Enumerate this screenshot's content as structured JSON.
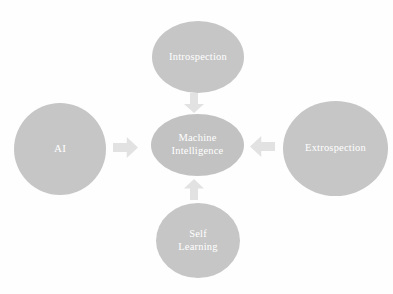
{
  "diagram": {
    "background_color": "#fefefe",
    "node_fill_color": "#c6c6c6",
    "node_text_color": "#ffffff",
    "arrow_color": "#e2e2e2",
    "nodes": [
      {
        "id": "ai",
        "label": "AI"
      },
      {
        "id": "introspection",
        "label": "Introspection"
      },
      {
        "id": "center",
        "label": "Machine\nIntelligence"
      },
      {
        "id": "extrospection",
        "label": "Extrospection"
      },
      {
        "id": "selflearning",
        "label": "Self\nLearning"
      }
    ],
    "arrows": [
      {
        "id": "ai-to-center",
        "direction": "right"
      },
      {
        "id": "introspection-to-center",
        "direction": "down"
      },
      {
        "id": "extrospection-to-center",
        "direction": "left"
      },
      {
        "id": "selflearning-to-center",
        "direction": "up"
      }
    ]
  }
}
